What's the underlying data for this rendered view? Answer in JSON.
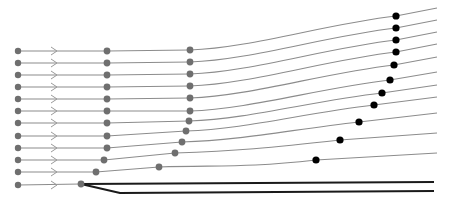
{
  "colors": {
    "trajectory": "#8c8c8c",
    "grey_node": "#6f6f6f",
    "black_node": "#000000",
    "thick_line": "#1a1a1a",
    "background": "#ffffff"
  },
  "rows": [
    {
      "y0": 51,
      "c1": [
        107,
        51
      ],
      "c2": [
        190,
        50
      ],
      "c3": [
        396,
        16
      ],
      "end": [
        437,
        8
      ]
    },
    {
      "y0": 63,
      "c1": [
        107,
        63
      ],
      "c2": [
        190,
        62
      ],
      "c3": [
        396,
        28
      ],
      "end": [
        437,
        20
      ]
    },
    {
      "y0": 75,
      "c1": [
        107,
        75
      ],
      "c2": [
        190,
        74
      ],
      "c3": [
        396,
        40
      ],
      "end": [
        437,
        32
      ]
    },
    {
      "y0": 87,
      "c1": [
        107,
        87
      ],
      "c2": [
        190,
        86
      ],
      "c3": [
        396,
        52
      ],
      "end": [
        437,
        44
      ]
    },
    {
      "y0": 99,
      "c1": [
        107,
        99
      ],
      "c2": [
        190,
        98
      ],
      "c3": [
        394,
        65
      ],
      "end": [
        437,
        57
      ]
    },
    {
      "y0": 111,
      "c1": [
        107,
        111
      ],
      "c2": [
        190,
        111
      ],
      "c3": [
        390,
        80
      ],
      "end": [
        437,
        72
      ]
    },
    {
      "y0": 123,
      "c1": [
        107,
        123
      ],
      "c2": [
        189,
        121
      ],
      "c3": [
        382,
        93
      ],
      "end": [
        437,
        85
      ]
    },
    {
      "y0": 136,
      "c1": [
        107,
        136
      ],
      "c2": [
        186,
        131
      ],
      "c3": [
        374,
        105
      ],
      "end": [
        437,
        97
      ]
    },
    {
      "y0": 148,
      "c1": [
        107,
        148
      ],
      "c2": [
        182,
        142
      ],
      "c3": [
        359,
        122
      ],
      "end": [
        437,
        113
      ]
    },
    {
      "y0": 160,
      "c1": [
        104,
        160
      ],
      "c2": [
        175,
        153
      ],
      "c3": [
        340,
        140
      ],
      "end": [
        437,
        133
      ]
    },
    {
      "y0": 172,
      "c1": [
        96,
        172
      ],
      "c2": [
        159,
        167
      ],
      "c3": [
        316,
        160
      ],
      "end": [
        437,
        153
      ]
    }
  ],
  "bottom_row": {
    "y0": 185,
    "node": [
      81,
      184
    ],
    "branch_upper": {
      "end": [
        434,
        182
      ]
    },
    "branch_lower": {
      "kink": [
        120,
        193
      ],
      "end": [
        434,
        191
      ]
    }
  },
  "start_x": 18,
  "chevron_x": 51
}
